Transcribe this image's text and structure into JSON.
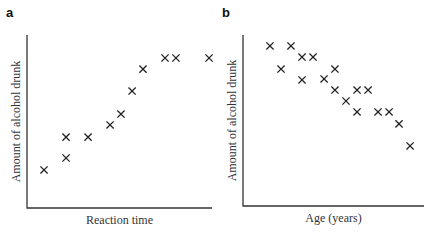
{
  "chart_data": [
    {
      "panel": "a",
      "type": "scatter",
      "title": "",
      "xlabel": "Reaction time",
      "ylabel": "Amount of alcohol drunk",
      "xlim": [
        0,
        100
      ],
      "ylim": [
        0,
        100
      ],
      "grid": false,
      "legend": null,
      "marker": "x",
      "x": [
        9.2,
        21.1,
        21.1,
        33.0,
        44.9,
        50.8,
        56.8,
        62.7,
        74.6,
        80.5,
        98.4
      ],
      "y": [
        22.0,
        28.9,
        41.0,
        41.0,
        48.0,
        54.3,
        67.6,
        80.3,
        86.7,
        86.7,
        86.7
      ],
      "frame": {
        "left": 27,
        "right": 212,
        "top": 35,
        "bottom": 208
      }
    },
    {
      "panel": "b",
      "type": "scatter",
      "title": "",
      "xlabel": "Age (years)",
      "ylabel": "Amount of alcohol drunk",
      "xlim": [
        0,
        100
      ],
      "ylim": [
        0,
        100
      ],
      "grid": false,
      "legend": null,
      "marker": "x",
      "x": [
        14.9,
        26.5,
        21.0,
        32.6,
        38.7,
        32.6,
        44.8,
        50.8,
        50.8,
        56.9,
        63.0,
        63.0,
        69.1,
        74.6,
        80.7,
        86.2,
        92.3
      ],
      "y": [
        93.6,
        93.6,
        80.1,
        87.1,
        87.1,
        73.7,
        74.3,
        80.1,
        67.8,
        61.4,
        55.0,
        67.8,
        67.8,
        55.0,
        55.0,
        48.0,
        35.1
      ],
      "frame": {
        "left": 243,
        "right": 424,
        "top": 35,
        "bottom": 206
      }
    }
  ],
  "panels": {
    "a": {
      "label": "a",
      "xlabel": "Reaction time",
      "ylabel": "Amount of alcohol drunk"
    },
    "b": {
      "label": "b",
      "xlabel": "Age (years)",
      "ylabel": "Amount of alcohol drunk"
    }
  },
  "colors": {
    "axis": "#333333",
    "marker": "#222222",
    "background": "#ffffff"
  }
}
